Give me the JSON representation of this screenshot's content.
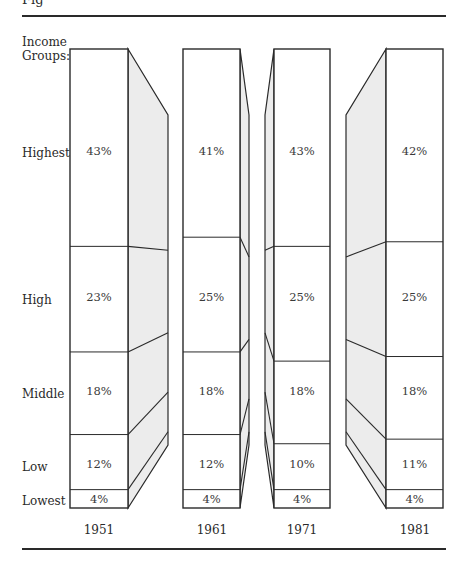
{
  "figure": {
    "partial_title": "Fig"
  },
  "y_header": {
    "line1": "Income",
    "line2": "Groups:"
  },
  "groups": [
    "Highest",
    "High",
    "Middle",
    "Low",
    "Lowest"
  ],
  "colors": {
    "line": "#2a2a2a",
    "side_fill": "#ececec",
    "front_fill": "#ffffff"
  },
  "chart_data": {
    "type": "bar",
    "subtype": "stacked-100-percent-3d",
    "title": "",
    "xlabel": "",
    "ylabel": "Income Groups",
    "categories": [
      "1951",
      "1961",
      "1971",
      "1981"
    ],
    "series": [
      {
        "name": "Highest",
        "values": [
          43,
          41,
          43,
          42
        ]
      },
      {
        "name": "High",
        "values": [
          23,
          25,
          25,
          25
        ]
      },
      {
        "name": "Middle",
        "values": [
          18,
          18,
          18,
          18
        ]
      },
      {
        "name": "Low",
        "values": [
          12,
          12,
          10,
          11
        ]
      },
      {
        "name": "Lowest",
        "values": [
          4,
          4,
          4,
          4
        ]
      }
    ],
    "labels": {
      "1951": [
        "43%",
        "23%",
        "18%",
        "12%",
        "4%"
      ],
      "1961": [
        "41%",
        "25%",
        "18%",
        "12%",
        "4%"
      ],
      "1971": [
        "43%",
        "25%",
        "18%",
        "10%",
        "4%"
      ],
      "1981": [
        "42%",
        "25%",
        "18%",
        "11%",
        "4%"
      ]
    },
    "ylim": [
      0,
      100
    ],
    "grid": false,
    "legend": "none (row labels on left)"
  }
}
